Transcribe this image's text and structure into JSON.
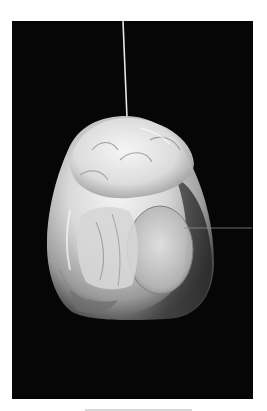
{
  "image": {
    "subject": "white carved stone pendant hanging from a string",
    "alt": "Photograph of a translucent white carved pendant suspended by a thin string against a black background"
  },
  "colors": {
    "page_background": "#ffffff",
    "photo_background": "#060606",
    "object_highlight": "#f2f2f2",
    "object_midtone": "#bdbdbd",
    "object_shadow": "#3a3a3a",
    "string": "#e6e6e6",
    "scan_line": "#8a8a8a",
    "bottom_mark": "#d8d8d8"
  },
  "layout": {
    "photo_frame": {
      "x": 12,
      "y": 21,
      "width": 241,
      "height": 378
    },
    "string": {
      "x1": 123,
      "y1": 21,
      "x2": 127,
      "y2": 117
    },
    "scan_line": {
      "x1": 184,
      "y1": 228,
      "x2": 252,
      "y2": 228
    },
    "bottom_mark": {
      "x": 85,
      "y": 409,
      "width": 107,
      "height": 2
    }
  }
}
